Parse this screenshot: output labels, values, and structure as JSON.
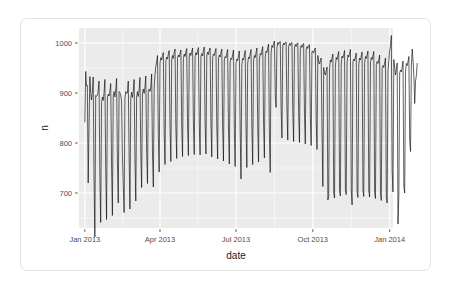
{
  "chart_data": {
    "type": "line",
    "title": "",
    "subtitle": "",
    "xlabel": "date",
    "ylabel": "n",
    "grid": true,
    "legend": null,
    "x_tick_labels": [
      "Jan 2013",
      "Apr 2013",
      "Jul 2013",
      "Oct 2013",
      "Jan 2014"
    ],
    "x_tick_values": [
      "2013-01-01",
      "2013-04-01",
      "2013-07-01",
      "2013-10-01",
      "2014-01-01"
    ],
    "y_tick_labels": [
      "700",
      "800",
      "900",
      "1000"
    ],
    "y_tick_values": [
      700,
      800,
      900,
      1000
    ],
    "ylim": [
      630,
      1030
    ],
    "xlim": [
      "2012-12-25",
      "2014-01-05"
    ],
    "series": [
      {
        "name": "n",
        "x_start": "2013-01-01",
        "x_step_days": 1,
        "values": [
          842,
          943,
          914,
          915,
          720,
          832,
          933,
          899,
          886,
          902,
          932,
          731,
          612,
          895,
          894,
          895,
          905,
          924,
          729,
          641,
          881,
          892,
          885,
          901,
          927,
          748,
          647,
          890,
          898,
          894,
          904,
          919,
          754,
          655,
          896,
          903,
          892,
          906,
          929,
          762,
          680,
          903,
          901,
          895,
          884,
          775,
          715,
          661,
          890,
          903,
          899,
          900,
          924,
          772,
          668,
          889,
          902,
          891,
          903,
          927,
          769,
          684,
          892,
          903,
          893,
          906,
          931,
          779,
          711,
          900,
          908,
          899,
          912,
          934,
          784,
          719,
          905,
          908,
          903,
          913,
          938,
          780,
          712,
          910,
          937,
          953,
          962,
          975,
          816,
          742,
          960,
          971,
          966,
          975,
          981,
          822,
          757,
          963,
          972,
          968,
          978,
          985,
          829,
          763,
          966,
          975,
          969,
          981,
          988,
          831,
          769,
          970,
          976,
          972,
          980,
          986,
          834,
          773,
          969,
          978,
          973,
          982,
          989,
          836,
          775,
          971,
          980,
          975,
          983,
          990,
          838,
          777,
          972,
          981,
          976,
          984,
          991,
          840,
          776,
          973,
          979,
          974,
          985,
          992,
          841,
          778,
          974,
          982,
          977,
          986,
          990,
          839,
          772,
          971,
          978,
          975,
          983,
          989,
          835,
          768,
          968,
          976,
          972,
          981,
          988,
          833,
          764,
          965,
          973,
          970,
          979,
          987,
          830,
          758,
          962,
          970,
          967,
          977,
          986,
          827,
          753,
          959,
          968,
          965,
          975,
          984,
          824,
          728,
          957,
          969,
          966,
          976,
          985,
          826,
          751,
          960,
          972,
          969,
          978,
          987,
          830,
          757,
          964,
          975,
          971,
          981,
          990,
          834,
          762,
          968,
          979,
          976,
          985,
          993,
          840,
          770,
          973,
          984,
          981,
          990,
          998,
          816,
          741,
          980,
          995,
          991,
          999,
          1004,
          896,
          871,
          989,
          1001,
          997,
          1002,
          1003,
          869,
          810,
          994,
          1000,
          996,
          1001,
          1002,
          866,
          806,
          992,
          999,
          995,
          1000,
          1001,
          863,
          803,
          990,
          997,
          993,
          999,
          1000,
          860,
          801,
          988,
          995,
          991,
          997,
          999,
          857,
          798,
          986,
          993,
          989,
          995,
          997,
          854,
          795,
          983,
          984,
          980,
          987,
          990,
          847,
          787,
          975,
          962,
          958,
          965,
          970,
          822,
          713,
          951,
          940,
          936,
          943,
          952,
          686,
          693,
          948,
          966,
          962,
          970,
          978,
          700,
          690,
          954,
          971,
          967,
          975,
          983,
          703,
          694,
          958,
          974,
          970,
          977,
          985,
          706,
          697,
          961,
          976,
          972,
          979,
          987,
          708,
          676,
          963,
          968,
          964,
          972,
          980,
          702,
          691,
          956,
          970,
          966,
          974,
          982,
          705,
          693,
          959,
          973,
          969,
          976,
          984,
          704,
          692,
          960,
          971,
          967,
          975,
          983,
          701,
          689,
          957,
          963,
          959,
          967,
          976,
          697,
          685,
          950,
          955,
          951,
          960,
          970,
          692,
          680,
          944,
          965,
          985,
          995,
          1015,
          744,
          702,
          967,
          952,
          936,
          947,
          960,
          638,
          697,
          940,
          946,
          942,
          951,
          964,
          712,
          700,
          943,
          959,
          955,
          963,
          973,
          805,
          783,
          953,
          988,
          966,
          933,
          879,
          924,
          935,
          959
        ]
      }
    ],
    "annotations": []
  },
  "axes": {
    "y_title": "n",
    "x_title": "date"
  },
  "colors": {
    "panel_background": "#ebebeb",
    "gridline": "#ffffff",
    "line": "#000000",
    "axis_text": "#4d4d4d",
    "axis_title": "#1a1a1a",
    "card_background": "#ffffff",
    "card_border": "#e3e3e3"
  }
}
